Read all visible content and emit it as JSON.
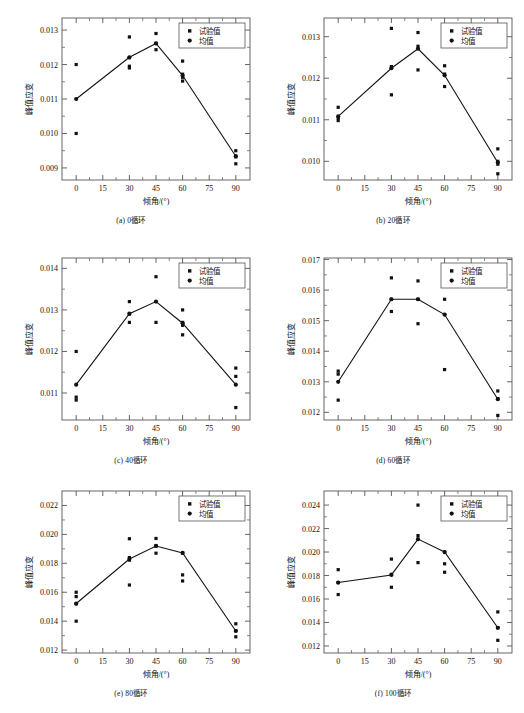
{
  "figure": {
    "axis_labels": {
      "x": "倾角/(°)",
      "y": "峰值应变"
    },
    "legend": {
      "series_points": "试验值",
      "series_mean": "均值"
    },
    "x_ticks": [
      "0",
      "15",
      "30",
      "45",
      "60",
      "75",
      "90"
    ],
    "colors": {
      "marker": "#111111",
      "line": "#111111",
      "axis": "#555555",
      "background": "#ffffff"
    }
  },
  "chart_data": [
    {
      "type": "scatter",
      "panel": "a",
      "title": "(a) 0循环",
      "xlabel": "倾角/(°)",
      "ylabel": "峰值应变",
      "xlim": [
        -8,
        98
      ],
      "ylim": [
        0.00865,
        0.01335
      ],
      "xticks": [
        0,
        15,
        30,
        45,
        60,
        75,
        90
      ],
      "yticks": [
        0.009,
        0.01,
        0.011,
        0.012,
        0.013
      ],
      "ytick_labels": [
        "0.009",
        "0.010",
        "0.011",
        "0.012",
        "0.013"
      ],
      "grid": false,
      "legend_position": "top-right",
      "series": [
        {
          "name": "试验值",
          "marker": "square",
          "x": [
            0,
            0,
            30,
            30,
            30,
            30,
            45,
            45,
            45,
            60,
            60,
            60,
            60,
            90,
            90,
            90
          ],
          "y": [
            0.012,
            0.01,
            0.0128,
            0.0122,
            0.01195,
            0.0119,
            0.0129,
            0.01262,
            0.01243,
            0.0121,
            0.01172,
            0.01163,
            0.01152,
            0.0095,
            0.00932,
            0.00912
          ]
        },
        {
          "name": "均值",
          "marker": "circle",
          "x": [
            0,
            30,
            45,
            60,
            90
          ],
          "y": [
            0.011,
            0.01221,
            0.01261,
            0.01168,
            0.00934
          ]
        }
      ]
    },
    {
      "type": "scatter",
      "panel": "b",
      "title": "(b) 20循环",
      "xlabel": "倾角/(°)",
      "ylabel": "峰值应变",
      "xlim": [
        -8,
        98
      ],
      "ylim": [
        0.00955,
        0.01345
      ],
      "xticks": [
        0,
        15,
        30,
        45,
        60,
        75,
        90
      ],
      "yticks": [
        0.01,
        0.011,
        0.012,
        0.013
      ],
      "ytick_labels": [
        "0.010",
        "0.011",
        "0.012",
        "0.013"
      ],
      "grid": false,
      "legend_position": "top-right",
      "series": [
        {
          "name": "试验值",
          "marker": "square",
          "x": [
            0,
            0,
            0,
            30,
            30,
            30,
            45,
            45,
            45,
            60,
            60,
            60,
            90,
            90,
            90,
            90
          ],
          "y": [
            0.0113,
            0.01105,
            0.01098,
            0.0132,
            0.01228,
            0.0116,
            0.0131,
            0.01277,
            0.0122,
            0.0123,
            0.0121,
            0.0118,
            0.0103,
            0.01,
            0.00993,
            0.0097
          ]
        },
        {
          "name": "均值",
          "marker": "circle",
          "x": [
            0,
            30,
            45,
            60,
            90
          ],
          "y": [
            0.01108,
            0.01224,
            0.01271,
            0.01207,
            0.00997
          ]
        }
      ]
    },
    {
      "type": "scatter",
      "panel": "c",
      "title": "(c) 40循环",
      "xlabel": "倾角/(°)",
      "ylabel": "峰值应变",
      "xlim": [
        -8,
        98
      ],
      "ylim": [
        0.01035,
        0.01425
      ],
      "xticks": [
        0,
        15,
        30,
        45,
        60,
        75,
        90
      ],
      "yticks": [
        0.011,
        0.012,
        0.013,
        0.014
      ],
      "ytick_labels": [
        "0.011",
        "0.012",
        "0.013",
        "0.014"
      ],
      "grid": false,
      "legend_position": "top-right",
      "series": [
        {
          "name": "试验值",
          "marker": "square",
          "x": [
            0,
            0,
            0,
            30,
            30,
            30,
            45,
            45,
            60,
            60,
            60,
            60,
            90,
            90,
            90
          ],
          "y": [
            0.012,
            0.0109,
            0.01083,
            0.0132,
            0.0129,
            0.0127,
            0.0138,
            0.0127,
            0.013,
            0.0127,
            0.01263,
            0.0124,
            0.0116,
            0.0114,
            0.01065
          ]
        },
        {
          "name": "均值",
          "marker": "circle",
          "x": [
            0,
            30,
            45,
            60,
            90
          ],
          "y": [
            0.0112,
            0.01291,
            0.0132,
            0.01268,
            0.0112
          ]
        }
      ]
    },
    {
      "type": "scatter",
      "panel": "d",
      "title": "(d) 60循环",
      "xlabel": "倾角/(°)",
      "ylabel": "峰值应变",
      "xlim": [
        -8,
        98
      ],
      "ylim": [
        0.01175,
        0.01705
      ],
      "xticks": [
        0,
        15,
        30,
        45,
        60,
        75,
        90
      ],
      "yticks": [
        0.012,
        0.013,
        0.014,
        0.015,
        0.016,
        0.017
      ],
      "ytick_labels": [
        "0.012",
        "0.013",
        "0.014",
        "0.015",
        "0.016",
        "0.017"
      ],
      "grid": false,
      "legend_position": "top-right",
      "series": [
        {
          "name": "试验值",
          "marker": "square",
          "x": [
            0,
            0,
            0,
            30,
            30,
            30,
            45,
            45,
            45,
            60,
            60,
            60,
            60,
            90,
            90,
            90
          ],
          "y": [
            0.01335,
            0.01325,
            0.0124,
            0.0164,
            0.0157,
            0.0153,
            0.0163,
            0.0157,
            0.0149,
            0.0164,
            0.0157,
            0.0152,
            0.0134,
            0.0127,
            0.01245,
            0.0119
          ]
        },
        {
          "name": "均值",
          "marker": "circle",
          "x": [
            0,
            30,
            45,
            60,
            90
          ],
          "y": [
            0.013,
            0.0157,
            0.0157,
            0.0152,
            0.01243
          ]
        }
      ]
    },
    {
      "type": "scatter",
      "panel": "e",
      "title": "(e) 80循环",
      "xlabel": "倾角/(°)",
      "ylabel": "峰值应变",
      "xlim": [
        -8,
        98
      ],
      "ylim": [
        0.0118,
        0.023
      ],
      "xticks": [
        0,
        15,
        30,
        45,
        60,
        75,
        90
      ],
      "yticks": [
        0.012,
        0.014,
        0.016,
        0.018,
        0.02,
        0.022
      ],
      "ytick_labels": [
        "0.012",
        "0.014",
        "0.016",
        "0.018",
        "0.020",
        "0.022"
      ],
      "grid": false,
      "legend_position": "top-right",
      "series": [
        {
          "name": "试验值",
          "marker": "square",
          "x": [
            0,
            0,
            0,
            0,
            30,
            30,
            30,
            30,
            45,
            45,
            45,
            60,
            60,
            60,
            60,
            90,
            90,
            90
          ],
          "y": [
            0.016,
            0.0157,
            0.0152,
            0.014,
            0.0197,
            0.0184,
            0.01822,
            0.0165,
            0.01972,
            0.0192,
            0.0187,
            0.022,
            0.01872,
            0.0172,
            0.01678,
            0.01382,
            0.01335,
            0.01292
          ]
        },
        {
          "name": "均值",
          "marker": "circle",
          "x": [
            0,
            30,
            45,
            60,
            90
          ],
          "y": [
            0.01522,
            0.0183,
            0.0192,
            0.01872,
            0.01332
          ]
        }
      ]
    },
    {
      "type": "scatter",
      "panel": "f",
      "title": "(f) 100循环",
      "xlabel": "倾角/(°)",
      "ylabel": "峰值应变",
      "xlim": [
        -8,
        98
      ],
      "ylim": [
        0.0114,
        0.0252
      ],
      "xticks": [
        0,
        15,
        30,
        45,
        60,
        75,
        90
      ],
      "yticks": [
        0.012,
        0.014,
        0.016,
        0.018,
        0.02,
        0.022,
        0.024
      ],
      "ytick_labels": [
        "0.012",
        "0.014",
        "0.016",
        "0.018",
        "0.020",
        "0.022",
        "0.024"
      ],
      "grid": false,
      "legend_position": "top-right",
      "series": [
        {
          "name": "试验值",
          "marker": "square",
          "x": [
            0,
            0,
            0,
            30,
            30,
            30,
            45,
            45,
            45,
            60,
            60,
            60,
            60,
            90,
            90,
            90
          ],
          "y": [
            0.0185,
            0.0174,
            0.01638,
            0.0194,
            0.0181,
            0.017,
            0.024,
            0.0214,
            0.0191,
            0.023,
            0.02,
            0.019,
            0.01828,
            0.0149,
            0.01355,
            0.01248
          ]
        },
        {
          "name": "均值",
          "marker": "circle",
          "x": [
            0,
            30,
            45,
            60,
            90
          ],
          "y": [
            0.0174,
            0.01805,
            0.0211,
            0.02,
            0.01355
          ]
        }
      ]
    }
  ]
}
